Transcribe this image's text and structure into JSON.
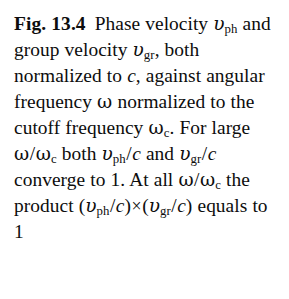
{
  "figure": {
    "label": "Fig. 13.4",
    "caption_full": "Fig. 13.4  Phase velocity vph and group velocity vgr, both normalized to c, against angular frequency ω normalized to the cutoff frequency ωc. For large ω/ωc both vph/c and vgr/c converge to 1. At all ω/ωc the product (vph/c)×(vgr/c) equals to 1",
    "text": {
      "t1": "Phase velocity",
      "t2": "and group velocity",
      "t3": ", both",
      "t4": "normalized to",
      "t5": ", against",
      "t6": "angular frequency",
      "t7": "normalized to the cutoff",
      "t8": "frequency",
      "t9": ". For large",
      "t10": "both",
      "t11": "and",
      "t12": "converge to 1. At all",
      "t13": "the product",
      "t14": "equals to 1"
    },
    "symbols": {
      "v": "υ",
      "sub_ph": "ph",
      "sub_gr": "gr",
      "c": "c",
      "omega": "ω",
      "sub_c": "c",
      "slash": "/",
      "times": "×",
      "paren_open": "(",
      "paren_close": ")"
    },
    "values": {
      "converge_limit": "1",
      "product_value": "1",
      "figure_number": "13.4",
      "chapter": "13"
    }
  },
  "style": {
    "text_color": "#0d0d0d",
    "background_color": "#ffffff"
  }
}
